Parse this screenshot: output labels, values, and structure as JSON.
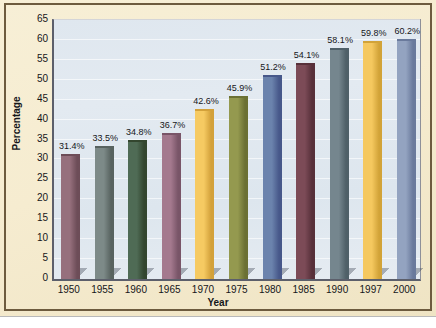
{
  "chart_data": {
    "type": "bar",
    "title": "",
    "xlabel": "Year",
    "ylabel": "Percentage",
    "categories": [
      "1950",
      "1955",
      "1960",
      "1965",
      "1970",
      "1975",
      "1980",
      "1985",
      "1990",
      "1997",
      "2000"
    ],
    "values": [
      31.4,
      33.5,
      34.8,
      36.7,
      42.6,
      45.9,
      51.2,
      54.1,
      58.1,
      59.8,
      60.2
    ],
    "data_labels": [
      "31.4%",
      "33.5%",
      "34.8%",
      "36.7%",
      "42.6%",
      "45.9%",
      "51.2%",
      "54.1%",
      "58.1%",
      "59.8%",
      "60.2%"
    ],
    "ylim": [
      0,
      65
    ],
    "ytick_labels": [
      "0",
      "5",
      "10",
      "15",
      "20",
      "25",
      "30",
      "35",
      "40",
      "45",
      "50",
      "55",
      "60",
      "65"
    ],
    "ytick_values": [
      0,
      5,
      10,
      15,
      20,
      25,
      30,
      35,
      40,
      45,
      50,
      55,
      60,
      65
    ],
    "grid": true,
    "legend": "none",
    "bar_colors": [
      "#96707d",
      "#7d8a88",
      "#4f6b55",
      "#a4798e",
      "#f6ca62",
      "#94994f",
      "#6b83ad",
      "#7c4b57",
      "#75868e",
      "#f5c85f",
      "#93a3c0"
    ],
    "bar_side_colors": [
      "#6d4d58",
      "#586360",
      "#33462f",
      "#795568",
      "#d3a13a",
      "#6b7033",
      "#47588a",
      "#57303a",
      "#4f6068",
      "#d2a338",
      "#6a7a9c"
    ],
    "plot_background": "#dfe7ef",
    "figure_background": "#f6ecd0",
    "frame_color": "#6d5b3e",
    "axis_color": "#5c5f6b"
  }
}
